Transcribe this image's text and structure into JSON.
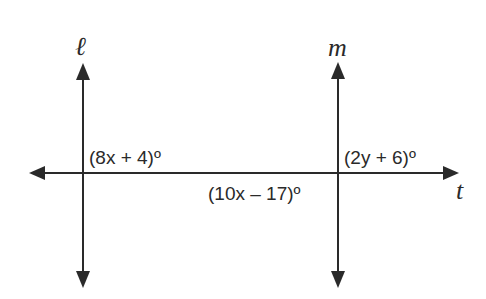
{
  "diagram": {
    "lines": {
      "l": {
        "name": "ℓ"
      },
      "m": {
        "name": "m"
      },
      "t": {
        "name": "t"
      }
    },
    "angles": {
      "a1": "(8x + 4)º",
      "a2": "(10x – 17)º",
      "a3": "(2y + 6)º"
    },
    "colors": {
      "stroke": "#2a2a2a",
      "background": "#ffffff"
    }
  }
}
